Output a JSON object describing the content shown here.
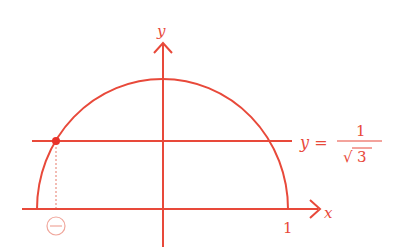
{
  "diagram": {
    "colors": {
      "stroke": "#e8493a",
      "dot": "#e8322a",
      "dotted": "#f0a79c",
      "circle_label": "#f0a79c"
    },
    "axes": {
      "x_label": "x",
      "y_label": "y",
      "x_tick_label": "1"
    },
    "curve": {
      "type": "upper semi-ellipse",
      "description": "arc from x=-1 to x=1 above x-axis"
    },
    "line": {
      "equation_lhs": "y =",
      "fraction_numerator": "1",
      "fraction_denominator_radical": "√",
      "fraction_denominator": "3"
    },
    "marker": {
      "description": "intersection point of line with arc on left side",
      "sign_label": "−"
    }
  }
}
